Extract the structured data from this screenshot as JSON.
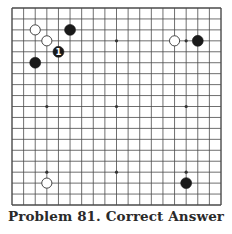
{
  "caption": "Problem 81. Correct Answer",
  "board": {
    "size": 19,
    "left": 12,
    "top": 8,
    "right": 221,
    "bottom": 205,
    "line_color": "#4a4a4a",
    "star_points": [
      [
        3,
        3
      ],
      [
        9,
        3
      ],
      [
        15,
        3
      ],
      [
        3,
        9
      ],
      [
        9,
        9
      ],
      [
        15,
        9
      ],
      [
        3,
        15
      ],
      [
        9,
        15
      ],
      [
        15,
        15
      ]
    ],
    "stones": [
      {
        "color": "white",
        "col": 2,
        "row": 2
      },
      {
        "color": "black",
        "col": 5,
        "row": 2
      },
      {
        "color": "white",
        "col": 3,
        "row": 3
      },
      {
        "color": "black",
        "col": 4,
        "row": 4,
        "label": "1"
      },
      {
        "color": "black",
        "col": 2,
        "row": 5
      },
      {
        "color": "white",
        "col": 14,
        "row": 3
      },
      {
        "color": "black",
        "col": 16,
        "row": 3
      },
      {
        "color": "white",
        "col": 3,
        "row": 16
      },
      {
        "color": "black",
        "col": 15,
        "row": 16
      }
    ]
  }
}
